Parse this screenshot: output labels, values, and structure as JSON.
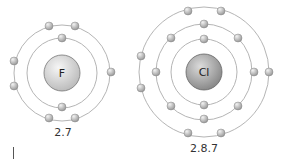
{
  "atoms": [
    {
      "symbol": "F",
      "configuration": "2.7",
      "center": [
        62,
        73
      ],
      "nucleus_radius": 18,
      "shells": [
        {
          "radius": 35,
          "electrons": 2
        },
        {
          "radius": 48,
          "electrons": 7
        }
      ]
    },
    {
      "symbol": "Cl",
      "configuration": "2.8.7",
      "center": [
        204,
        72
      ],
      "nucleus_radius": 18,
      "shells": [
        {
          "radius": 33,
          "electrons": 2
        },
        {
          "radius": 48,
          "electrons": 8
        },
        {
          "radius": 65,
          "electrons": 7
        }
      ]
    }
  ],
  "colors": {
    "orbit": "#b5b5b5",
    "nucleus_F": "#d4d4d4",
    "nucleus_Cl": "#a8a8a8",
    "electron": "#c2c2c2"
  }
}
